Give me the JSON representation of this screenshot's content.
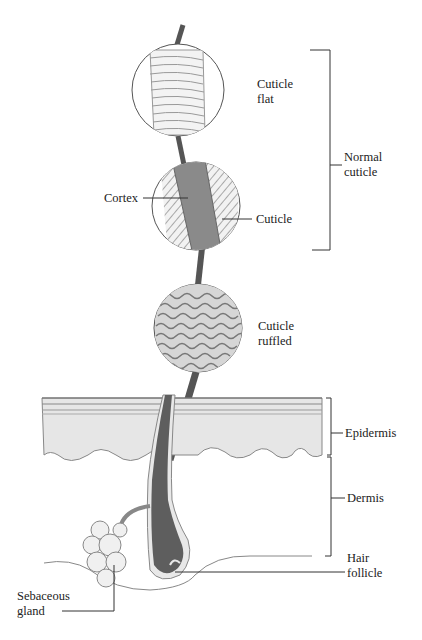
{
  "diagram": {
    "labels": {
      "cuticle_flat": [
        "Cuticle",
        "flat"
      ],
      "normal_cuticle": [
        "Normal",
        "cuticle"
      ],
      "cortex": "Cortex",
      "cuticle": "Cuticle",
      "cuticle_ruffled": [
        "Cuticle",
        "ruffled"
      ],
      "epidermis": "Epidermis",
      "dermis": "Dermis",
      "hair_follicle": [
        "Hair",
        "follicle"
      ],
      "sebaceous_gland": [
        "Sebaceous",
        "gland"
      ]
    },
    "colors": {
      "hair_shaft": "#555555",
      "cortex": "#8a8a8a",
      "epidermis": "#e6e6e6",
      "follicle": "#5e5e5e"
    }
  }
}
